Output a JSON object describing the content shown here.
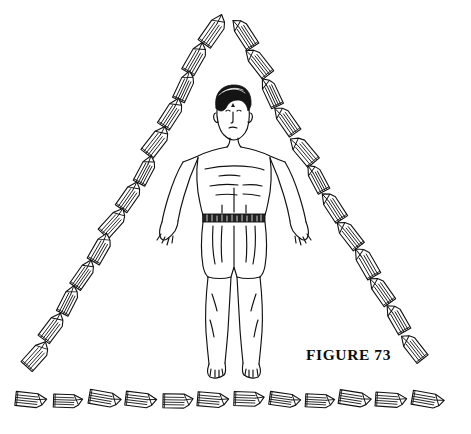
{
  "figure": {
    "caption": "FIGURE  73",
    "caption_x": 306,
    "caption_y": 346,
    "ink_color": "#111111",
    "background_color": "#ffffff"
  },
  "diagram": {
    "title_visible": "FIGURE  73",
    "layout": "triangular-crystal-grid",
    "description_parts": [
      "standing male figure, arms lowered and outward, wearing shorts with patterned belt",
      "quartz crystal points arranged along three sides of a triangle"
    ]
  },
  "human_figure": {
    "head": {
      "cx": 232,
      "cy": 113
    },
    "forehead_mark": "third-eye-dot",
    "hair": "short-dark-hair",
    "belt_pattern": "dark-hatched-band",
    "garment": "shorts",
    "feet": "bare-feet"
  },
  "crystals": {
    "count_total": 37,
    "count_left_side": 12,
    "count_right_side": 11,
    "count_bottom_row": 12,
    "count_apex": 2,
    "style": "hexagonal-prism-line-art",
    "left_side": [
      {
        "x": 214,
        "y": 30,
        "rot": 35,
        "len": 34,
        "w": 15
      },
      {
        "x": 196,
        "y": 58,
        "rot": 30,
        "len": 33,
        "w": 14
      },
      {
        "x": 185,
        "y": 86,
        "rot": 25,
        "len": 31,
        "w": 13
      },
      {
        "x": 172,
        "y": 113,
        "rot": 33,
        "len": 32,
        "w": 14
      },
      {
        "x": 157,
        "y": 141,
        "rot": 38,
        "len": 33,
        "w": 15
      },
      {
        "x": 146,
        "y": 170,
        "rot": 28,
        "len": 30,
        "w": 13
      },
      {
        "x": 130,
        "y": 196,
        "rot": 35,
        "len": 31,
        "w": 14
      },
      {
        "x": 114,
        "y": 222,
        "rot": 42,
        "len": 32,
        "w": 14
      },
      {
        "x": 101,
        "y": 248,
        "rot": 30,
        "len": 31,
        "w": 14
      },
      {
        "x": 84,
        "y": 274,
        "rot": 35,
        "len": 31,
        "w": 13
      },
      {
        "x": 69,
        "y": 300,
        "rot": 27,
        "len": 30,
        "w": 13
      },
      {
        "x": 53,
        "y": 327,
        "rot": 37,
        "len": 31,
        "w": 14
      },
      {
        "x": 37,
        "y": 355,
        "rot": 42,
        "len": 31,
        "w": 15
      }
    ],
    "right_side": [
      {
        "x": 244,
        "y": 33,
        "rot": -33,
        "len": 33,
        "w": 14
      },
      {
        "x": 258,
        "y": 62,
        "rot": -38,
        "len": 33,
        "w": 14
      },
      {
        "x": 271,
        "y": 92,
        "rot": -25,
        "len": 31,
        "w": 13
      },
      {
        "x": 286,
        "y": 120,
        "rot": -35,
        "len": 32,
        "w": 14
      },
      {
        "x": 303,
        "y": 150,
        "rot": -40,
        "len": 33,
        "w": 15
      },
      {
        "x": 317,
        "y": 178,
        "rot": -28,
        "len": 30,
        "w": 13
      },
      {
        "x": 333,
        "y": 206,
        "rot": -33,
        "len": 32,
        "w": 14
      },
      {
        "x": 349,
        "y": 234,
        "rot": -38,
        "len": 32,
        "w": 14
      },
      {
        "x": 366,
        "y": 262,
        "rot": -30,
        "len": 33,
        "w": 15
      },
      {
        "x": 381,
        "y": 290,
        "rot": -35,
        "len": 31,
        "w": 14
      },
      {
        "x": 397,
        "y": 318,
        "rot": -30,
        "len": 31,
        "w": 14
      },
      {
        "x": 413,
        "y": 347,
        "rot": -38,
        "len": 31,
        "w": 14
      }
    ],
    "bottom_row": [
      {
        "x": 31,
        "y": 400,
        "rot": 96,
        "len": 31,
        "w": 14
      },
      {
        "x": 68,
        "y": 401,
        "rot": 92,
        "len": 29,
        "w": 13
      },
      {
        "x": 105,
        "y": 399,
        "rot": 100,
        "len": 32,
        "w": 14
      },
      {
        "x": 141,
        "y": 400,
        "rot": 97,
        "len": 31,
        "w": 14
      },
      {
        "x": 178,
        "y": 401,
        "rot": 91,
        "len": 30,
        "w": 14
      },
      {
        "x": 213,
        "y": 400,
        "rot": 95,
        "len": 31,
        "w": 14
      },
      {
        "x": 249,
        "y": 399,
        "rot": 92,
        "len": 30,
        "w": 14
      },
      {
        "x": 285,
        "y": 400,
        "rot": 98,
        "len": 31,
        "w": 13
      },
      {
        "x": 320,
        "y": 401,
        "rot": 93,
        "len": 29,
        "w": 13
      },
      {
        "x": 355,
        "y": 399,
        "rot": 99,
        "len": 32,
        "w": 14
      },
      {
        "x": 391,
        "y": 400,
        "rot": 94,
        "len": 31,
        "w": 14
      },
      {
        "x": 428,
        "y": 400,
        "rot": 100,
        "len": 32,
        "w": 14
      }
    ]
  }
}
